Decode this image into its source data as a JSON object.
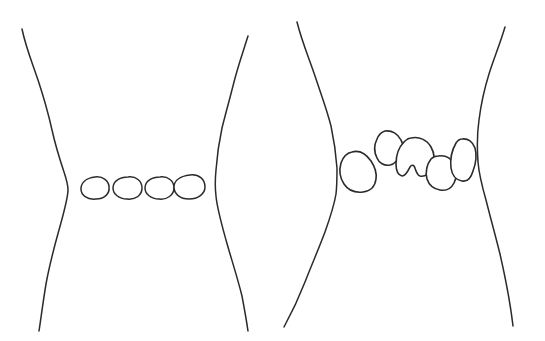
{
  "document": {
    "title": "Hand-drawn constriction diagram",
    "background_color": "#ffffff",
    "ink_color": "#2b2b2b",
    "width": 545,
    "height": 341,
    "panel_count": 2,
    "caption": ""
  },
  "panels": [
    {
      "id": "panel-left",
      "name": "left-panel",
      "label": "",
      "description": "Two wavy vertical contour lines forming a narrow waist with a single horizontal row of four smooth oval blobs spanning the gap",
      "contours": [
        {
          "name": "left-outer-contour",
          "side": "left",
          "path": "M22,29 C26,48 32,62 38,80 C44,98 48,112 52,130 C56,148 60,160 64,172 C67,181 68,186 68,190 C68,198 64,212 59,230 C54,248 50,262 46,284 C43,302 41,318 39,331"
        },
        {
          "name": "right-outer-contour",
          "side": "right",
          "path": "M248,36 C243,52 238,66 234,82 C230,98 226,112 222,128 C219,142 217,156 216,170 C215,180 215,188 216,196 C217,208 221,222 226,240 C231,258 237,276 242,296 C245,312 247,324 248,331"
        }
      ],
      "blobs": [
        {
          "name": "blob-oval-1",
          "shape": "oval",
          "cx": 95,
          "cy": 188,
          "rx": 14,
          "ry": 11
        },
        {
          "name": "blob-oval-2",
          "shape": "oval",
          "cx": 127,
          "cy": 188,
          "rx": 14,
          "ry": 11
        },
        {
          "name": "blob-oval-3",
          "shape": "oval",
          "cx": 159,
          "cy": 188,
          "rx": 14,
          "ry": 11
        },
        {
          "name": "blob-oval-4",
          "shape": "oval",
          "cx": 189,
          "cy": 187,
          "rx": 15,
          "ry": 12
        }
      ],
      "blob_count": 4,
      "blob_arrangement": "single aligned row, uniform smooth ovals"
    },
    {
      "id": "panel-right",
      "name": "right-panel",
      "label": "",
      "description": "Two wavy vertical contour lines forming a narrow waist with five irregular angular blobs staggered across the gap",
      "contours": [
        {
          "name": "left-outer-contour",
          "side": "left",
          "path": "M297,22 C302,42 309,58 315,76 C321,94 327,110 331,126 C334,140 336,154 337,168 C337,178 337,186 336,194 C334,206 330,218 325,232 C319,248 312,264 305,282 C298,300 290,316 284,327"
        },
        {
          "name": "right-outer-contour",
          "side": "right",
          "path": "M505,27 C500,44 494,58 489,74 C484,90 481,104 479,120 C477,134 477,148 478,162 C479,174 482,186 486,200 C490,216 495,234 500,254 C505,276 510,300 513,326"
        }
      ],
      "blobs": [
        {
          "name": "blob-irregular-1",
          "shape": "irregular",
          "cx": 357,
          "cy": 170,
          "label": ""
        },
        {
          "name": "blob-irregular-2",
          "shape": "irregular",
          "cx": 388,
          "cy": 147,
          "label": ""
        },
        {
          "name": "blob-irregular-3",
          "shape": "irregular",
          "cx": 416,
          "cy": 158,
          "label": ""
        },
        {
          "name": "blob-irregular-4",
          "shape": "irregular",
          "cx": 440,
          "cy": 173,
          "label": ""
        },
        {
          "name": "blob-irregular-5",
          "shape": "irregular",
          "cx": 463,
          "cy": 161,
          "label": ""
        }
      ],
      "blob_count": 5,
      "blob_arrangement": "staggered cluster, irregular angular outlines of varying size"
    }
  ]
}
